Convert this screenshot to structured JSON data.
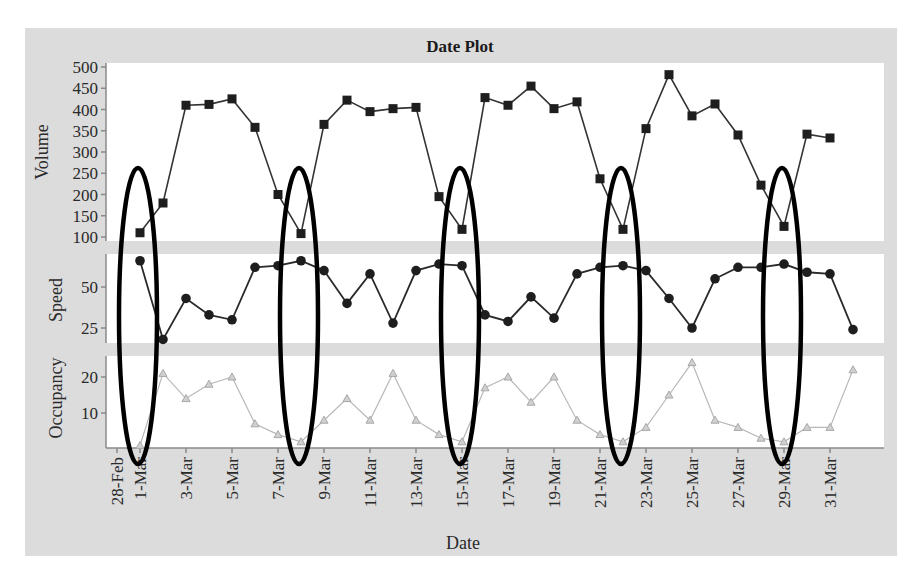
{
  "chart_data": {
    "type": "line",
    "title": "Date Plot",
    "xlabel": "Date",
    "x_tick_labels": [
      "28-Feb",
      "1-Mar",
      "3-Mar",
      "5-Mar",
      "7-Mar",
      "9-Mar",
      "11-Mar",
      "13-Mar",
      "15-Mar",
      "17-Mar",
      "19-Mar",
      "21-Mar",
      "23-Mar",
      "25-Mar",
      "27-Mar",
      "29-Mar",
      "31-Mar"
    ],
    "x": [
      "1-Mar",
      "2-Mar",
      "3-Mar",
      "4-Mar",
      "5-Mar",
      "6-Mar",
      "7-Mar",
      "8-Mar",
      "9-Mar",
      "10-Mar",
      "11-Mar",
      "12-Mar",
      "13-Mar",
      "14-Mar",
      "15-Mar",
      "16-Mar",
      "17-Mar",
      "18-Mar",
      "19-Mar",
      "20-Mar",
      "21-Mar",
      "22-Mar",
      "23-Mar",
      "24-Mar",
      "25-Mar",
      "26-Mar",
      "27-Mar",
      "28-Mar",
      "29-Mar",
      "30-Mar",
      "31-Mar"
    ],
    "panels": [
      {
        "name": "Volume",
        "ylabel": "Volume",
        "ylim": [
          100,
          500
        ],
        "yticks": [
          100,
          150,
          200,
          250,
          300,
          350,
          400,
          450,
          500
        ],
        "marker": "square",
        "color": "#222222",
        "values": [
          110,
          180,
          410,
          412,
          425,
          358,
          200,
          108,
          365,
          422,
          395,
          402,
          405,
          195,
          118,
          428,
          410,
          455,
          402,
          418,
          237,
          118,
          355,
          482,
          385,
          413,
          340,
          222,
          125,
          342,
          333
        ]
      },
      {
        "name": "Speed",
        "ylabel": "Speed",
        "ylim": [
          15,
          70
        ],
        "yticks": [
          25,
          50
        ],
        "marker": "circle",
        "color": "#222222",
        "values": [
          66,
          18,
          43,
          33,
          30,
          62,
          63,
          66,
          60,
          40,
          58,
          28,
          60,
          64,
          63,
          33,
          29,
          44,
          31,
          58,
          62,
          63,
          60,
          43,
          25,
          55,
          62,
          62,
          64,
          59,
          58,
          24
        ]
      },
      {
        "name": "Occupancy",
        "ylabel": "Occupancy",
        "ylim": [
          0,
          25
        ],
        "yticks": [
          10,
          20
        ],
        "marker": "triangle",
        "color": "#b0b0b0",
        "values": [
          1,
          21,
          14,
          18,
          20,
          7,
          4,
          2,
          8,
          14,
          8,
          21,
          8,
          4,
          2,
          17,
          20,
          13,
          20,
          8,
          4,
          2,
          6,
          15,
          24,
          8,
          6,
          3,
          2,
          6,
          6,
          22
        ]
      }
    ],
    "annotations": [
      {
        "type": "ellipse",
        "date": "1-Mar",
        "note": "low volume / high speed / low occupancy"
      },
      {
        "type": "ellipse",
        "date": "8-Mar"
      },
      {
        "type": "ellipse",
        "date": "15-Mar"
      },
      {
        "type": "ellipse",
        "date": "22-Mar"
      },
      {
        "type": "ellipse",
        "date": "29-Mar"
      }
    ],
    "grid": false,
    "legend": "none"
  },
  "labels": {
    "title": "Date Plot",
    "xlabel": "Date",
    "volume": "Volume",
    "speed": "Speed",
    "occupancy": "Occupancy"
  }
}
